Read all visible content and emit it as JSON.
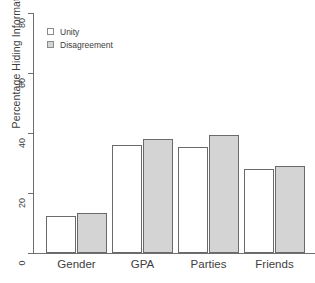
{
  "chart_data": {
    "type": "bar",
    "title": "",
    "xlabel": "",
    "ylabel": "Percentage Hiding Information",
    "ylim": [
      0,
      80
    ],
    "yticks": [
      0,
      20,
      40,
      60,
      80
    ],
    "grid": false,
    "legend_position": "top-left",
    "categories": [
      "Gender",
      "GPA",
      "Parties",
      "Friends"
    ],
    "series": [
      {
        "name": "Unity",
        "color": "#ffffff",
        "values": [
          12.2,
          36.0,
          35.3,
          28.0
        ]
      },
      {
        "name": "Disagreement",
        "color": "#d4d4d4",
        "values": [
          13.3,
          38.0,
          39.3,
          29.0
        ]
      }
    ]
  },
  "axis": {
    "y_title": "Percentage Hiding Information",
    "y_tick_labels": [
      "0",
      "20",
      "40",
      "60",
      "80"
    ],
    "x_tick_labels": [
      "Gender",
      "GPA",
      "Parties",
      "Friends"
    ]
  },
  "legend": {
    "items": [
      {
        "label": "Unity",
        "swatch": "legend-swatch-unity"
      },
      {
        "label": "Disagreement",
        "swatch": "legend-swatch-disagreement"
      }
    ]
  }
}
